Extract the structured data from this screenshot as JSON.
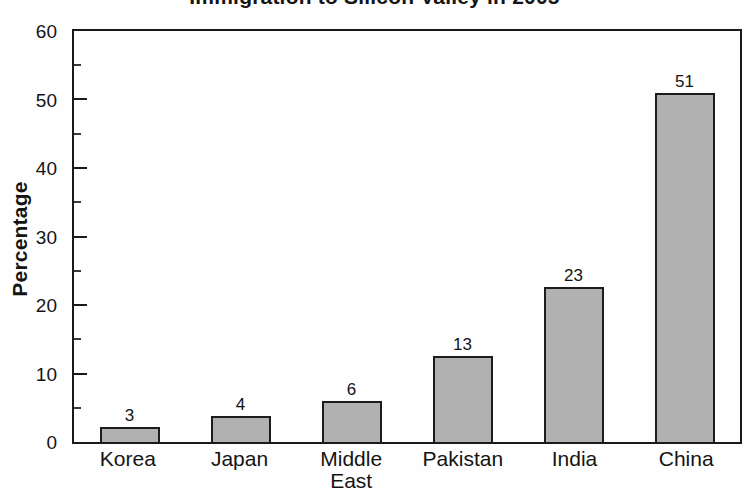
{
  "chart": {
    "title": "Immigration to Silicon Valley in 2005",
    "y_axis_title": "Percentage"
  },
  "chart_data": {
    "type": "bar",
    "title": "Immigration to Silicon Valley in 2005",
    "categories": [
      "Korea",
      "Japan",
      "Middle East",
      "Pakistan",
      "India",
      "China"
    ],
    "values": [
      3,
      4,
      6,
      13,
      23,
      51
    ],
    "bar_labels": [
      "3",
      "4",
      "6",
      "13",
      "23",
      "51"
    ],
    "rendered_bar_heights": [
      2.2,
      3.8,
      6.0,
      12.6,
      22.7,
      51.0
    ],
    "xlabel": "",
    "ylabel": "Percentage",
    "ylim": [
      0,
      60
    ],
    "y_major_ticks": [
      0,
      10,
      20,
      30,
      40,
      50,
      60
    ],
    "y_minor_tick_step": 5,
    "grid": false,
    "legend": false,
    "bar_fill_color": "#b1b1b1",
    "bar_border_color": "#1c1c1c",
    "title_partially_cut_off_at_top": true
  }
}
